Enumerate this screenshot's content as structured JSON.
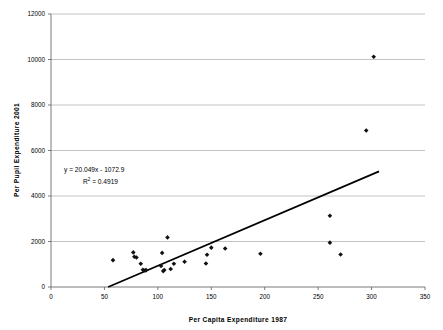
{
  "chart_data": {
    "type": "scatter",
    "title": "",
    "xlabel": "Per Capita Expenditure 1987",
    "ylabel": "Per Pupil Expenditure 2001",
    "xlim": [
      0,
      350
    ],
    "ylim": [
      0,
      12000
    ],
    "xticks": [
      0,
      50,
      100,
      150,
      200,
      250,
      300,
      350
    ],
    "yticks": [
      0,
      2000,
      4000,
      6000,
      8000,
      10000,
      12000
    ],
    "xtick_labels": [
      "0",
      "50",
      "100",
      "150",
      "200",
      "250",
      "300",
      "350"
    ],
    "ytick_labels": [
      "0",
      "2000",
      "4000",
      "6000",
      "8000",
      "10000",
      "12000"
    ],
    "grid": "horizontal",
    "legend": "none",
    "marker_color": "#111111",
    "gridline_color": "#a9a9a9",
    "trendline_color": "#000000",
    "annotations": {
      "equation": "y = 20.049x - 1072.9",
      "r_squared_prefix": "R",
      "r_squared_exponent": "2",
      "r_squared_value": " = 0.4919"
    },
    "trendline": {
      "slope": 20.049,
      "intercept": -1072.9,
      "x_start": 53.5,
      "x_end": 307,
      "y_start": 0,
      "y_end": 5082.1
    },
    "points": [
      {
        "x": 58,
        "y": 1180
      },
      {
        "x": 77,
        "y": 1520
      },
      {
        "x": 78,
        "y": 1330
      },
      {
        "x": 80,
        "y": 1300
      },
      {
        "x": 84,
        "y": 1020
      },
      {
        "x": 86,
        "y": 760
      },
      {
        "x": 88,
        "y": 730
      },
      {
        "x": 89,
        "y": 740
      },
      {
        "x": 103,
        "y": 920
      },
      {
        "x": 104,
        "y": 1500
      },
      {
        "x": 105,
        "y": 700
      },
      {
        "x": 106,
        "y": 750
      },
      {
        "x": 109,
        "y": 2180
      },
      {
        "x": 112,
        "y": 790
      },
      {
        "x": 115,
        "y": 1020
      },
      {
        "x": 125,
        "y": 1110
      },
      {
        "x": 145,
        "y": 1030
      },
      {
        "x": 146,
        "y": 1420
      },
      {
        "x": 150,
        "y": 1730
      },
      {
        "x": 163,
        "y": 1690
      },
      {
        "x": 196,
        "y": 1460
      },
      {
        "x": 261,
        "y": 3130
      },
      {
        "x": 261,
        "y": 1950
      },
      {
        "x": 271,
        "y": 1430
      },
      {
        "x": 295,
        "y": 6880
      },
      {
        "x": 302,
        "y": 10120
      }
    ]
  }
}
